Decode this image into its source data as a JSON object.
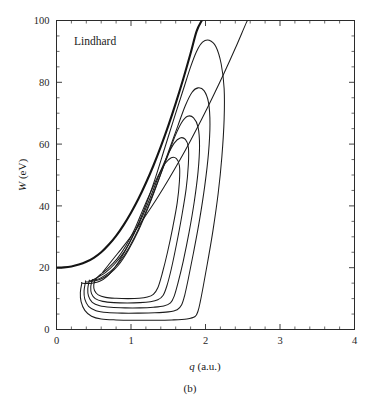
{
  "figure": {
    "annotation": "Lindhard",
    "caption": "(b)"
  },
  "chart_data": {
    "type": "line",
    "title": "Lindhard",
    "subtitle": "(b)",
    "xlabel": "q (a.u.)",
    "xlabel_symbol": "q",
    "xlabel_units": "(a.u.)",
    "ylabel": "W (eV)",
    "ylabel_symbol": "W",
    "ylabel_units": "(eV)",
    "xlim": [
      0,
      4
    ],
    "ylim": [
      0,
      100
    ],
    "xticks": [
      0,
      1,
      2,
      3,
      4
    ],
    "xtick_labels": [
      "0",
      "1",
      "2",
      "3",
      "4"
    ],
    "yticks": [
      0,
      20,
      40,
      60,
      80,
      100
    ],
    "ytick_labels": [
      "0",
      "20",
      "40",
      "60",
      "80",
      "100"
    ],
    "x_minor_tick_step": 0.2,
    "y_minor_tick_step": 5,
    "grid": false,
    "legend": "none",
    "frame": "box",
    "line_color": "#1c1c1c",
    "background_color": "#ffffff",
    "series": [
      {
        "name": "dispersion-boundary",
        "style": "thick",
        "closed": false,
        "points": [
          [
            0.0,
            20.0
          ],
          [
            0.1,
            20.1
          ],
          [
            0.2,
            20.4
          ],
          [
            0.3,
            21.0
          ],
          [
            0.4,
            21.9
          ],
          [
            0.5,
            23.2
          ],
          [
            0.6,
            25.0
          ],
          [
            0.7,
            27.4
          ],
          [
            0.8,
            30.3
          ],
          [
            0.9,
            33.8
          ],
          [
            1.0,
            37.8
          ],
          [
            1.1,
            42.3
          ],
          [
            1.2,
            47.4
          ],
          [
            1.3,
            53.0
          ],
          [
            1.4,
            59.2
          ],
          [
            1.5,
            65.9
          ],
          [
            1.6,
            73.2
          ],
          [
            1.7,
            81.0
          ],
          [
            1.8,
            89.4
          ],
          [
            1.88,
            96.5
          ],
          [
            1.95,
            100.0
          ]
        ]
      },
      {
        "name": "open-curve-outer",
        "style": "thin",
        "closed": false,
        "points": [
          [
            0.62,
            18.5
          ],
          [
            0.75,
            22.5
          ],
          [
            0.9,
            27.0
          ],
          [
            1.05,
            31.8
          ],
          [
            1.2,
            37.0
          ],
          [
            1.35,
            42.5
          ],
          [
            1.5,
            48.4
          ],
          [
            1.65,
            54.6
          ],
          [
            1.8,
            61.2
          ],
          [
            1.95,
            68.1
          ],
          [
            2.1,
            75.4
          ],
          [
            2.25,
            83.0
          ],
          [
            2.4,
            91.0
          ],
          [
            2.55,
            99.4
          ],
          [
            2.57,
            100.0
          ]
        ]
      },
      {
        "name": "contour-loop-1",
        "style": "thin",
        "closed": true,
        "apex": [
          2.02,
          93.5
        ],
        "points": [
          [
            0.34,
            15.0
          ],
          [
            0.32,
            12.0
          ],
          [
            0.33,
            9.0
          ],
          [
            0.38,
            6.2
          ],
          [
            0.47,
            4.3
          ],
          [
            0.6,
            3.4
          ],
          [
            0.8,
            3.1
          ],
          [
            1.05,
            3.0
          ],
          [
            1.3,
            3.0
          ],
          [
            1.55,
            3.1
          ],
          [
            1.75,
            3.4
          ],
          [
            1.86,
            4.2
          ],
          [
            1.9,
            6.0
          ],
          [
            1.93,
            9.0
          ],
          [
            1.97,
            14.0
          ],
          [
            2.03,
            22.0
          ],
          [
            2.1,
            32.0
          ],
          [
            2.17,
            44.0
          ],
          [
            2.22,
            56.0
          ],
          [
            2.25,
            68.0
          ],
          [
            2.25,
            78.0
          ],
          [
            2.21,
            86.0
          ],
          [
            2.14,
            91.5
          ],
          [
            2.05,
            93.6
          ],
          [
            1.96,
            93.0
          ],
          [
            1.88,
            90.0
          ],
          [
            1.8,
            85.0
          ],
          [
            1.7,
            77.5
          ],
          [
            1.58,
            68.5
          ],
          [
            1.45,
            58.5
          ],
          [
            1.32,
            48.5
          ],
          [
            1.18,
            39.0
          ],
          [
            1.04,
            31.0
          ],
          [
            0.9,
            24.5
          ],
          [
            0.78,
            20.0
          ],
          [
            0.68,
            17.2
          ],
          [
            0.58,
            15.6
          ],
          [
            0.48,
            15.0
          ],
          [
            0.4,
            14.9
          ],
          [
            0.34,
            15.0
          ]
        ]
      },
      {
        "name": "contour-loop-2",
        "style": "thin",
        "closed": true,
        "apex": [
          1.82,
          77.0
        ],
        "points": [
          [
            0.39,
            15.5
          ],
          [
            0.37,
            12.5
          ],
          [
            0.38,
            9.8
          ],
          [
            0.43,
            7.5
          ],
          [
            0.53,
            6.1
          ],
          [
            0.68,
            5.5
          ],
          [
            0.88,
            5.3
          ],
          [
            1.1,
            5.3
          ],
          [
            1.32,
            5.4
          ],
          [
            1.5,
            5.7
          ],
          [
            1.62,
            6.4
          ],
          [
            1.68,
            8.0
          ],
          [
            1.72,
            11.0
          ],
          [
            1.77,
            16.5
          ],
          [
            1.84,
            25.0
          ],
          [
            1.92,
            35.5
          ],
          [
            1.99,
            46.5
          ],
          [
            2.04,
            57.0
          ],
          [
            2.06,
            66.5
          ],
          [
            2.04,
            73.5
          ],
          [
            1.98,
            77.3
          ],
          [
            1.9,
            78.2
          ],
          [
            1.82,
            76.8
          ],
          [
            1.73,
            72.5
          ],
          [
            1.63,
            66.0
          ],
          [
            1.51,
            58.0
          ],
          [
            1.38,
            49.0
          ],
          [
            1.24,
            40.0
          ],
          [
            1.1,
            32.0
          ],
          [
            0.96,
            25.5
          ],
          [
            0.83,
            20.8
          ],
          [
            0.7,
            17.8
          ],
          [
            0.58,
            16.2
          ],
          [
            0.48,
            15.6
          ],
          [
            0.42,
            15.4
          ],
          [
            0.39,
            15.5
          ]
        ]
      },
      {
        "name": "contour-loop-3",
        "style": "thin",
        "closed": true,
        "apex": [
          1.7,
          68.0
        ],
        "points": [
          [
            0.44,
            15.8
          ],
          [
            0.42,
            13.2
          ],
          [
            0.43,
            10.8
          ],
          [
            0.48,
            8.8
          ],
          [
            0.58,
            7.7
          ],
          [
            0.73,
            7.2
          ],
          [
            0.92,
            7.0
          ],
          [
            1.12,
            7.0
          ],
          [
            1.3,
            7.2
          ],
          [
            1.44,
            7.6
          ],
          [
            1.53,
            8.6
          ],
          [
            1.58,
            10.8
          ],
          [
            1.63,
            15.0
          ],
          [
            1.7,
            22.0
          ],
          [
            1.78,
            31.5
          ],
          [
            1.85,
            41.5
          ],
          [
            1.9,
            51.0
          ],
          [
            1.92,
            59.5
          ],
          [
            1.9,
            65.5
          ],
          [
            1.84,
            68.5
          ],
          [
            1.76,
            69.0
          ],
          [
            1.68,
            67.0
          ],
          [
            1.59,
            62.5
          ],
          [
            1.49,
            56.0
          ],
          [
            1.37,
            48.5
          ],
          [
            1.24,
            40.5
          ],
          [
            1.11,
            33.0
          ],
          [
            0.98,
            26.8
          ],
          [
            0.85,
            22.0
          ],
          [
            0.72,
            18.7
          ],
          [
            0.6,
            16.8
          ],
          [
            0.51,
            16.0
          ],
          [
            0.46,
            15.8
          ],
          [
            0.44,
            15.8
          ]
        ]
      },
      {
        "name": "contour-loop-4",
        "style": "thin",
        "closed": true,
        "apex": [
          1.56,
          61.0
        ],
        "points": [
          [
            0.48,
            16.0
          ],
          [
            0.46,
            13.8
          ],
          [
            0.47,
            11.6
          ],
          [
            0.52,
            10.0
          ],
          [
            0.62,
            9.1
          ],
          [
            0.77,
            8.7
          ],
          [
            0.95,
            8.6
          ],
          [
            1.12,
            8.7
          ],
          [
            1.26,
            9.0
          ],
          [
            1.36,
            9.6
          ],
          [
            1.43,
            11.0
          ],
          [
            1.48,
            14.0
          ],
          [
            1.54,
            19.5
          ],
          [
            1.61,
            27.5
          ],
          [
            1.68,
            36.5
          ],
          [
            1.74,
            45.5
          ],
          [
            1.77,
            53.5
          ],
          [
            1.77,
            59.0
          ],
          [
            1.73,
            61.5
          ],
          [
            1.66,
            62.0
          ],
          [
            1.58,
            60.3
          ],
          [
            1.49,
            56.3
          ],
          [
            1.39,
            50.8
          ],
          [
            1.28,
            44.0
          ],
          [
            1.16,
            37.0
          ],
          [
            1.03,
            30.5
          ],
          [
            0.91,
            25.2
          ],
          [
            0.78,
            21.2
          ],
          [
            0.66,
            18.5
          ],
          [
            0.56,
            17.0
          ],
          [
            0.5,
            16.2
          ],
          [
            0.48,
            16.0
          ]
        ]
      },
      {
        "name": "contour-loop-5",
        "style": "thin",
        "closed": true,
        "apex": [
          1.44,
          54.0
        ],
        "points": [
          [
            0.52,
            16.2
          ],
          [
            0.5,
            14.4
          ],
          [
            0.51,
            12.6
          ],
          [
            0.56,
            11.2
          ],
          [
            0.66,
            10.4
          ],
          [
            0.8,
            10.1
          ],
          [
            0.96,
            10.0
          ],
          [
            1.11,
            10.1
          ],
          [
            1.22,
            10.5
          ],
          [
            1.3,
            11.4
          ],
          [
            1.36,
            13.5
          ],
          [
            1.42,
            18.2
          ],
          [
            1.49,
            25.0
          ],
          [
            1.56,
            33.0
          ],
          [
            1.62,
            41.0
          ],
          [
            1.65,
            48.0
          ],
          [
            1.65,
            53.0
          ],
          [
            1.61,
            55.3
          ],
          [
            1.54,
            55.6
          ],
          [
            1.46,
            53.8
          ],
          [
            1.37,
            50.0
          ],
          [
            1.27,
            44.8
          ],
          [
            1.16,
            38.8
          ],
          [
            1.05,
            32.5
          ],
          [
            0.93,
            27.0
          ],
          [
            0.81,
            22.8
          ],
          [
            0.69,
            19.8
          ],
          [
            0.59,
            17.8
          ],
          [
            0.54,
            16.7
          ],
          [
            0.52,
            16.2
          ]
        ]
      }
    ]
  }
}
